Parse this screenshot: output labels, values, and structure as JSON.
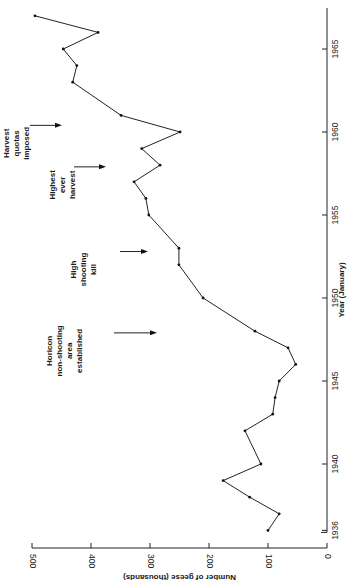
{
  "chart_data": {
    "type": "line",
    "orientation": "rotated-90-clockwise (year axis vertical on right, value axis horizontal at bottom)",
    "title": "",
    "xlabel": "Year (January)",
    "ylabel": "Number of geese (thousands)",
    "xlim": [
      1936,
      1967
    ],
    "ylim": [
      0,
      500
    ],
    "x_ticks": [
      1936,
      1940,
      1945,
      1950,
      1955,
      1960,
      1965
    ],
    "y_ticks": [
      0,
      100,
      200,
      300,
      400,
      500
    ],
    "grid": false,
    "legend": null,
    "series": [
      {
        "name": "Number of geese",
        "x": [
          1936,
          1937,
          1938,
          1939,
          1940,
          1942,
          1943,
          1944,
          1945,
          1946,
          1947,
          1948,
          1950,
          1952,
          1953,
          1955,
          1956,
          1957,
          1958,
          1959,
          1960,
          1961,
          1963,
          1964,
          1965,
          1966,
          1967
        ],
        "values": [
          100,
          81,
          131,
          176,
          112,
          139,
          92,
          88,
          81,
          53,
          66,
          122,
          210,
          251,
          251,
          302,
          307,
          327,
          283,
          314,
          249,
          349,
          431,
          424,
          447,
          388,
          495
        ]
      }
    ],
    "annotations": [
      {
        "lines": [
          "Horicon",
          "non-shooting",
          "area",
          "established"
        ],
        "year": 1947.9
      },
      {
        "lines": [
          "High",
          "shooting",
          "kill"
        ],
        "year": 1952.8
      },
      {
        "lines": [
          "Highest",
          "ever",
          "harvest"
        ],
        "year": 1957.9
      },
      {
        "lines": [
          "Harvest",
          "quotas",
          "imposed"
        ],
        "year": 1960.4
      }
    ]
  },
  "axes": {
    "value_axis_label": "Number of geese (thousands)",
    "year_axis_label": "Year (January)",
    "value_tick_labels": [
      "0",
      "100",
      "200",
      "300",
      "400",
      "500"
    ],
    "year_tick_labels": [
      "1936",
      "1940",
      "1945",
      "1950",
      "1955",
      "1960",
      "1965"
    ]
  }
}
